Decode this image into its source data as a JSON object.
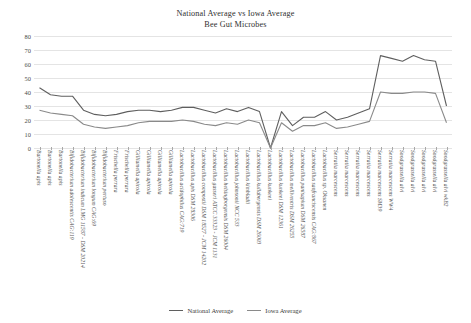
{
  "chart": {
    "title_line_1": "National Average vs Iowa Average",
    "title_line_2": "Bee Gut Microbes"
  },
  "legend": {
    "position": "bottom-center",
    "items": [
      {
        "label": "National Average",
        "color": "#5f5f5f"
      },
      {
        "label": "Iowa Average",
        "color": "#8a8a8a"
      }
    ]
  },
  "chart_data": {
    "type": "line",
    "title": "National Average vs Iowa Average Bee Gut Microbes",
    "xlabel": "",
    "ylabel": "",
    "ylim": [
      0,
      80
    ],
    "yticks": [
      0,
      10,
      20,
      30,
      40,
      50,
      60,
      70,
      80
    ],
    "grid": true,
    "categories": [
      "Bartonella apis",
      "Bartonella apis",
      "Bartonella apis",
      "Bifidobacterium adolescentis CAG:119",
      "Bifidobacterium indicum LMG 11587 - DSM 20214",
      "Bifidobacterium longum CAG:69",
      "Bifidobacterium pertuso",
      "Frischella perrara",
      "Frischella perrara",
      "Gilliamella apicola",
      "Gilliamella apicola",
      "Gilliamella apicola",
      "Gilliamella apicola",
      "Lactobacillus acidophilus CAG:719",
      "Lactobacillus apis DSM 28306",
      "Lactobacillus compostii DSM 18527 - JCM 14202",
      "Lactobacillus gasseri ATCC 33323 - JCM 1131",
      "Lactobacillus helsingborgensis DSM 26004",
      "Lactobacillus johnsonii NCC 533",
      "Lactobacillus kimbladii",
      "Lactobacillus kullabergensis DSM 26003",
      "Lactobacillus kunkeei",
      "Lactobacillus kunkeei DSM 12361",
      "Lactobacillus melliventris DSM 26255",
      "Lactobacillus panisapium DSM 26587",
      "Lactobacillus sanfranciscensis CAG:867",
      "Lactobacillus sp. Oksanen",
      "Serratia marcescens",
      "Serratia marcescens",
      "Serratia marcescens",
      "Serratia marcescens",
      "Serratia marcescens SM39",
      "Serratia marcescens WW4",
      "Snodgrassella alvi",
      "Snodgrassella alvi",
      "Snodgrassella alvi",
      "Snodgrassella alvi",
      "Snodgrassella alvi wkB2"
    ],
    "series": [
      {
        "name": "National Average",
        "color": "#5f5f5f",
        "values": [
          43,
          38,
          37,
          37,
          27,
          24,
          23,
          24,
          26,
          27,
          27,
          26,
          27,
          29,
          29,
          27,
          25,
          28,
          26,
          29,
          26,
          0,
          26,
          16,
          22,
          22,
          26,
          20,
          22,
          25,
          28,
          66,
          64,
          62,
          66,
          63,
          62,
          30
        ]
      },
      {
        "name": "Iowa Average",
        "color": "#8a8a8a",
        "values": [
          27,
          25,
          24,
          23,
          17,
          15,
          14,
          15,
          16,
          18,
          19,
          19,
          19,
          20,
          19,
          17,
          16,
          18,
          17,
          20,
          18,
          0,
          18,
          12,
          16,
          16,
          18,
          14,
          15,
          17,
          19,
          40,
          39,
          39,
          40,
          40,
          39,
          18
        ]
      }
    ]
  }
}
